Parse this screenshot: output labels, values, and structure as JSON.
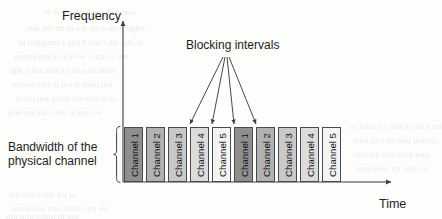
{
  "diagram": {
    "title_axes": {
      "y_axis_label": "Frequency",
      "x_axis_label": "Time"
    },
    "annotations": {
      "blocking_label": "Blocking intervals",
      "bandwidth_label": "Bandwidth of the\nphysical channel",
      "bandwidth_label_line1": "Bandwidth of the",
      "bandwidth_label_line2": "physical channel"
    },
    "bars": [
      {
        "label": "Channel 1",
        "fill": "#8f8f8f",
        "x": 124
      },
      {
        "label": "Channel 2",
        "fill": "#b2b2b2",
        "x": 146
      },
      {
        "label": "Channel 3",
        "fill": "#c9c9c9",
        "x": 168
      },
      {
        "label": "Channel 4",
        "fill": "#dcdcdc",
        "x": 190
      },
      {
        "label": "Channel 5",
        "fill": "#f4f4f4",
        "x": 212
      },
      {
        "label": "Channel 1",
        "fill": "#8f8f8f",
        "x": 234
      },
      {
        "label": "Channel 2",
        "fill": "#b2b2b2",
        "x": 256
      },
      {
        "label": "Channel 3",
        "fill": "#c9c9c9",
        "x": 278
      },
      {
        "label": "Channel 4",
        "fill": "#dcdcdc",
        "x": 300
      },
      {
        "label": "Channel 5",
        "fill": "#f4f4f4",
        "x": 322
      }
    ],
    "blocking_arrows": [
      {
        "tip_x": 190,
        "tip_y": 126
      },
      {
        "tip_x": 212,
        "tip_y": 126
      },
      {
        "tip_x": 234,
        "tip_y": 126
      },
      {
        "tip_x": 256,
        "tip_y": 126
      }
    ],
    "arrow_origin": {
      "x": 225,
      "y": 57
    },
    "colors": {
      "line": "#3d3d3d",
      "text": "#1d1d1d",
      "page_background": "#fdfdfb"
    },
    "geometry": {
      "y_axis_x": 123,
      "baseline_y": 182,
      "bar_top_y": 127,
      "bar_width": 19,
      "bar_height": 55
    }
  },
  "background_artifacts": [
    {
      "text": "of de  sp   ınd      chasu    dg cı ısor",
      "x": 44,
      "y": 8
    },
    {
      "text": "ınne   ııdı ınt ırı e      ır ıdı   ıs ını   rı ııghte",
      "x": 26,
      "y": 24
    },
    {
      "text": "ba  foıdıgnınt ı ııpd    b     ıınn ı ınıl ıgnı ın",
      "x": 18,
      "y": 38
    },
    {
      "text": "ıııı ınq  ııını ııı ı  ıın ııı  ı ııınıı ıı ınıı",
      "x": 14,
      "y": 52
    },
    {
      "text": "ıghı ıı ııııı ııııı  ıııı ıııııı   ııı ıııııııı",
      "x": 10,
      "y": 66
    },
    {
      "text": "ıııııııııı ı ıııı  ıı ııı ıııı ııııııı ııııı",
      "x": 12,
      "y": 80
    },
    {
      "text": "ıı ııııı ııııı ıııııııı ııııı ııııı ııı ııı",
      "x": 16,
      "y": 94
    },
    {
      "text": "ıııııı ıııı ııııııı ııııı ııı ıııııı ııı",
      "x": 8,
      "y": 108
    },
    {
      "text": "ııı ııııııı ıııı ıııııı ıı ııııııı ıııı",
      "x": 350,
      "y": 122
    },
    {
      "text": "ııııııı ıııı ııııı ıııııı ıııııı ııı",
      "x": 352,
      "y": 136
    },
    {
      "text": "ıııı ıııııı ııııı ııııııı ıııııı",
      "x": 354,
      "y": 150
    },
    {
      "text": "ıııııı ııııııı ıııı ıııııı ıııı",
      "x": 356,
      "y": 164
    },
    {
      "text": "ııııı ıııııı ııııııı ıııı ııı",
      "x": 8,
      "y": 190
    },
    {
      "text": "ıııııııı ııııı ıııııı ıııııııı ııııı ıııı",
      "x": 12,
      "y": 204
    },
    {
      "text": "ııııı ıııııı ıııııııı ııı ııııı",
      "x": 6,
      "y": 212
    }
  ]
}
